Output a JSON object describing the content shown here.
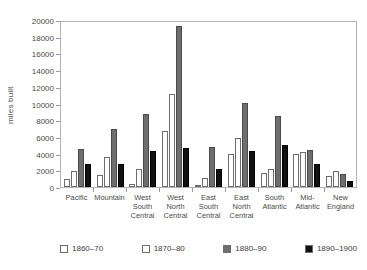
{
  "chart_data": {
    "type": "bar",
    "title": "",
    "subtitle": "",
    "xlabel": "",
    "ylabel": "miles built",
    "ylim": [
      0,
      20000
    ],
    "ytick_step": 2000,
    "yticks": [
      "0",
      "2000",
      "4000",
      "6000",
      "8000",
      "10000",
      "12000",
      "14000",
      "16000",
      "18000",
      "20000"
    ],
    "grid": false,
    "legend_position": "bottom",
    "categories": [
      "Pacific",
      "Mountain",
      "West\nSouth\nCentral",
      "West\nNorth\nCentral",
      "East\nSouth\nCentral",
      "East\nNorth\nCentral",
      "South\nAtlantic",
      "Mid-\nAtlantic",
      "New\nEngland"
    ],
    "series": [
      {
        "name": "1860–70",
        "color": "#ffffff",
        "values": [
          1000,
          1400,
          400,
          6700,
          200,
          4000,
          1700,
          3900,
          1300
        ]
      },
      {
        "name": "1870–80",
        "color": "#fdfdfd",
        "values": [
          1900,
          3600,
          2200,
          11100,
          1100,
          5900,
          2100,
          4200,
          1900
        ]
      },
      {
        "name": "1880–90",
        "color": "#6e6e6e",
        "values": [
          4600,
          7000,
          8700,
          19300,
          4800,
          10100,
          8500,
          4400,
          1500
        ]
      },
      {
        "name": "1890–1900",
        "color": "#111111",
        "values": [
          2800,
          2700,
          4300,
          4700,
          2200,
          4300,
          5000,
          2700,
          700
        ]
      }
    ]
  }
}
